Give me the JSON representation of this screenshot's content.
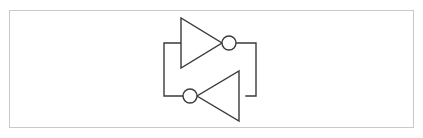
{
  "page": {
    "width": 423,
    "height": 138,
    "background_color": "#ffffff"
  },
  "cut_text": {
    "label": "— —  —— ——— —— — ——",
    "color": "#b9b9b9",
    "note": "clipped caption line"
  },
  "figure_panel": {
    "name": "cross-coupled-inverter-figure",
    "border_color": "#c9c9c9",
    "background_color": "#ffffff",
    "x": 9,
    "y": 10,
    "width": 405,
    "height": 118
  },
  "schematic": {
    "type": "logic-circuit",
    "title": "Cross-coupled inverter pair (bistable latch)",
    "stroke_color": "#3a3a3a",
    "fill_color": "#ffffff",
    "stroke_width": 1.4,
    "viewbox": {
      "x": 0,
      "y": 0,
      "width": 405,
      "height": 118
    },
    "components": [
      {
        "id": "inverter-top",
        "type": "inverter",
        "orientation": "right",
        "triangle": {
          "back_x": 171,
          "top_y": 7,
          "bottom_y": 57,
          "apex_x": 212,
          "apex_y": 32
        },
        "bubble": {
          "cx": 219,
          "cy": 32,
          "r": 7
        }
      },
      {
        "id": "inverter-bottom",
        "type": "inverter",
        "orientation": "left",
        "triangle": {
          "back_x": 229,
          "top_y": 60,
          "bottom_y": 110,
          "apex_x": 187,
          "apex_y": 85
        },
        "bubble": {
          "cx": 180,
          "cy": 85,
          "r": 7
        }
      }
    ],
    "wires": [
      {
        "id": "feedback-right",
        "points": "226,32 246,32 246,85 236,85"
      },
      {
        "id": "feedback-left",
        "points": "171,32 154,32 154,85 173,85"
      }
    ]
  }
}
